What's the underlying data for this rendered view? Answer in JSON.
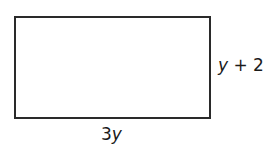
{
  "diagram": {
    "shape": "rectangle",
    "width_label": {
      "coef": "3",
      "var": "y"
    },
    "height_label": {
      "var": "y",
      "rest": " + 2"
    }
  }
}
